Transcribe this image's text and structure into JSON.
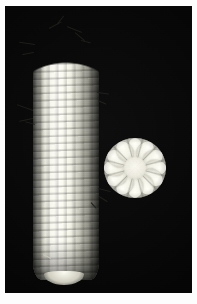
{
  "image": {
    "subject": "White corn ear with cross-section slice",
    "caption": "",
    "background_color": "#050505",
    "border_color": "#ffffff",
    "kernel_color": "#fffef6",
    "shadow_color": "#4a4a43",
    "silk_color": "#1a1a16",
    "width": 197,
    "height": 304
  },
  "plate": {
    "label": "photo-plate",
    "left": 5,
    "top": 6,
    "width": 187,
    "height": 287
  },
  "specimens": [
    {
      "name": "corn-ear",
      "description": "Whole ear of white dent corn, tip up, blunt butt down",
      "kernel_rows_visible": 8,
      "kernel_ranks_visible": 32,
      "left": 28,
      "top": 24,
      "width": 66,
      "height": 250
    },
    {
      "name": "corn-cross-section",
      "description": "Transverse slice of the ear showing kernels radiating from the cob",
      "lobes": 12,
      "left": 99,
      "top": 132,
      "width": 62,
      "height": 60
    }
  ],
  "silk_strands": [
    {
      "left": 44,
      "top": 22,
      "length": 14,
      "angle": -28,
      "tone": "dark"
    },
    {
      "left": 52,
      "top": 18,
      "length": 11,
      "angle": -52,
      "tone": "dark"
    },
    {
      "left": 62,
      "top": 20,
      "length": 16,
      "angle": 22,
      "tone": "dark"
    },
    {
      "left": 70,
      "top": 26,
      "length": 13,
      "angle": 40,
      "tone": "dark"
    },
    {
      "left": 76,
      "top": 34,
      "length": 10,
      "angle": 14,
      "tone": "dark"
    },
    {
      "left": 30,
      "top": 38,
      "length": 16,
      "angle": 188,
      "tone": "dark"
    },
    {
      "left": 29,
      "top": 46,
      "length": 12,
      "angle": 170,
      "tone": "dark"
    },
    {
      "left": 28,
      "top": 104,
      "length": 17,
      "angle": 200,
      "tone": "dark"
    },
    {
      "left": 28,
      "top": 112,
      "length": 14,
      "angle": 168,
      "tone": "dark"
    },
    {
      "left": 30,
      "top": 118,
      "length": 10,
      "angle": 196,
      "tone": "dark"
    },
    {
      "left": 92,
      "top": 86,
      "length": 12,
      "angle": 8,
      "tone": "dark"
    },
    {
      "left": 93,
      "top": 94,
      "length": 9,
      "angle": 24,
      "tone": "dark"
    },
    {
      "left": 93,
      "top": 182,
      "length": 13,
      "angle": 14,
      "tone": "dark"
    },
    {
      "left": 94,
      "top": 190,
      "length": 10,
      "angle": 32,
      "tone": "dark"
    },
    {
      "left": 86,
      "top": 196,
      "length": 8,
      "angle": 48,
      "tone": "dark"
    },
    {
      "left": 46,
      "top": 252,
      "length": 9,
      "angle": 206,
      "tone": "light"
    }
  ]
}
